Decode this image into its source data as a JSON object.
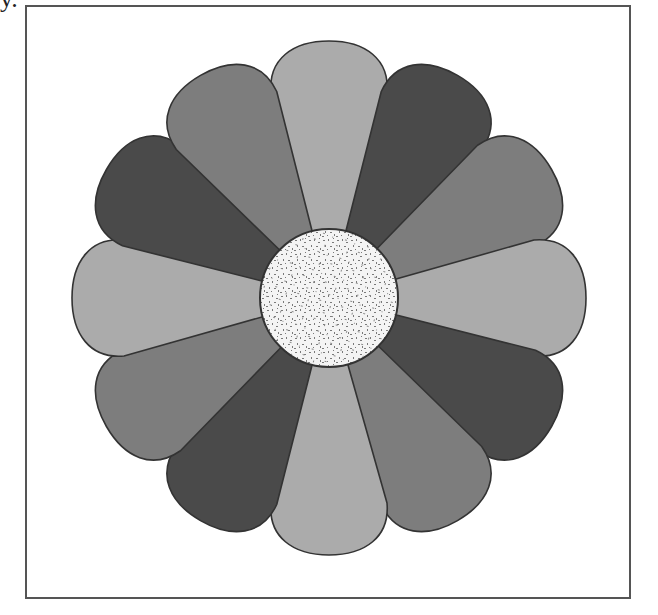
{
  "page": {
    "corner_text": "y."
  },
  "figure": {
    "center": [
      329,
      298
    ],
    "center_radius": 69,
    "petal_count": 12,
    "petal_outer_radius": 257,
    "petal_sequence_clockwise_from_top": [
      "light",
      "dark",
      "medium",
      "light",
      "dark",
      "medium",
      "light",
      "dark",
      "medium",
      "light",
      "dark",
      "medium"
    ],
    "colors": {
      "light": "#ababab",
      "medium": "#7d7d7d",
      "dark": "#4a4a4a",
      "outline": "#333333",
      "center_fill": "#f4f4f4",
      "center_speckle": "#7a7a7a",
      "frame": "#555555"
    }
  }
}
